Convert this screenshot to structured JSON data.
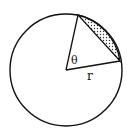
{
  "diagram": {
    "type": "circle-segment",
    "labels": {
      "angle": "θ",
      "radius": "r"
    },
    "colors": {
      "stroke": "#111111",
      "background": "#ffffff",
      "shading": "#333333"
    }
  }
}
